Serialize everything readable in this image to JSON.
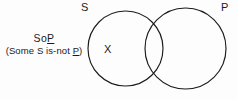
{
  "figure": {
    "type": "venn-diagram",
    "background_color": "#fdfdfd",
    "stroke_color": "#1b1b1b",
    "text_color": "#1b1b1b",
    "circles": [
      {
        "name": "S",
        "label": "S",
        "cx": 125.5,
        "cy": 48.5,
        "r": 37.5
      },
      {
        "name": "P",
        "label": "P",
        "cx": 185.5,
        "cy": 48.5,
        "r": 40.5
      }
    ],
    "markers": [
      {
        "name": "existential-x",
        "symbol": "X",
        "region": "S-only",
        "x": 108,
        "y": 49
      }
    ]
  },
  "annotation": {
    "code_prefix": "So",
    "code_underlined": "P",
    "gloss_prefix": "(Some S is-not ",
    "gloss_underlined": "P",
    "gloss_suffix": ")"
  },
  "labels": {
    "subject": "S",
    "predicate": "P"
  }
}
